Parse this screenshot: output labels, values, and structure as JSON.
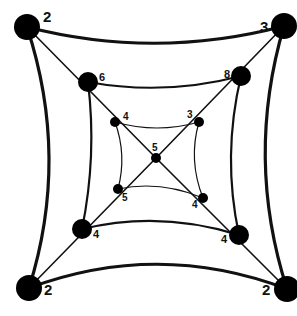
{
  "diagram": {
    "type": "nested-square-graph",
    "colors": {
      "stroke": "#111111",
      "node": "#000000",
      "background": "#ffffff"
    },
    "nodes": [
      {
        "id": "outer-tl",
        "ring": "outer",
        "x": 27,
        "y": 27,
        "r": 13,
        "label": "2",
        "lx": 43,
        "ly": 22,
        "fs": 15
      },
      {
        "id": "outer-tr",
        "ring": "outer",
        "x": 284,
        "y": 26,
        "r": 13,
        "label": "3",
        "lx": 260,
        "ly": 32,
        "fs": 15
      },
      {
        "id": "outer-bl",
        "ring": "outer",
        "x": 29,
        "y": 288,
        "r": 13,
        "label": "2",
        "lx": 44,
        "ly": 295,
        "fs": 15
      },
      {
        "id": "outer-br",
        "ring": "outer",
        "x": 287,
        "y": 289,
        "r": 13,
        "label": "2",
        "lx": 262,
        "ly": 295,
        "fs": 15
      },
      {
        "id": "middle-tl",
        "ring": "middle",
        "x": 88,
        "y": 82,
        "r": 10,
        "label": "6",
        "lx": 99,
        "ly": 81,
        "fs": 11
      },
      {
        "id": "middle-tr",
        "ring": "middle",
        "x": 241,
        "y": 76,
        "r": 10,
        "label": "8",
        "lx": 224,
        "ly": 78,
        "fs": 11
      },
      {
        "id": "middle-bl",
        "ring": "middle",
        "x": 82,
        "y": 229,
        "r": 10,
        "label": "4",
        "lx": 93,
        "ly": 238,
        "fs": 11
      },
      {
        "id": "middle-br",
        "ring": "middle",
        "x": 239,
        "y": 235,
        "r": 10,
        "label": "4",
        "lx": 221,
        "ly": 243,
        "fs": 11
      },
      {
        "id": "inner-tl",
        "ring": "inner",
        "x": 115,
        "y": 122,
        "r": 5,
        "label": "4",
        "lx": 123,
        "ly": 120,
        "fs": 10
      },
      {
        "id": "inner-tr",
        "ring": "inner",
        "x": 199,
        "y": 122,
        "r": 5,
        "label": "3",
        "lx": 187,
        "ly": 118,
        "fs": 10
      },
      {
        "id": "inner-bl",
        "ring": "inner",
        "x": 118,
        "y": 189,
        "r": 5,
        "label": "5",
        "lx": 122,
        "ly": 201,
        "fs": 10
      },
      {
        "id": "inner-br",
        "ring": "inner",
        "x": 203,
        "y": 198,
        "r": 5,
        "label": "4",
        "lx": 192,
        "ly": 208,
        "fs": 10
      },
      {
        "id": "center",
        "ring": "center",
        "x": 156,
        "y": 158,
        "r": 5,
        "label": "5",
        "lx": 152,
        "ly": 151,
        "fs": 10
      }
    ],
    "edges": [
      {
        "id": "outer-top",
        "d": "M27,27 Q156,60 284,26",
        "w": 3.2
      },
      {
        "id": "outer-right",
        "d": "M284,26 Q245,158 287,289",
        "w": 3.2
      },
      {
        "id": "outer-bottom",
        "d": "M29,288 Q158,240 287,289",
        "w": 3.2
      },
      {
        "id": "outer-left",
        "d": "M27,27 Q70,158 29,288",
        "w": 3.2
      },
      {
        "id": "middle-top",
        "d": "M88,82 Q165,96 241,76",
        "w": 2.2
      },
      {
        "id": "middle-right",
        "d": "M241,76 Q222,156 239,235",
        "w": 2.2
      },
      {
        "id": "middle-bottom",
        "d": "M82,229 Q160,210 239,235",
        "w": 2.2
      },
      {
        "id": "middle-left",
        "d": "M88,82 Q97,156 82,229",
        "w": 2.2
      },
      {
        "id": "inner-top",
        "d": "M115,122 Q157,134 199,122",
        "w": 1.2
      },
      {
        "id": "inner-right",
        "d": "M199,122 Q188,160 203,198",
        "w": 1.2
      },
      {
        "id": "inner-bottom",
        "d": "M118,189 Q160,180 203,198",
        "w": 1.2
      },
      {
        "id": "inner-left",
        "d": "M115,122 Q127,155 118,189",
        "w": 1.2
      },
      {
        "id": "diag-tl",
        "d": "M27,27 L156,158",
        "w": 1.6
      },
      {
        "id": "diag-tr",
        "d": "M284,26 L156,158",
        "w": 1.6
      },
      {
        "id": "diag-bl",
        "d": "M29,288 L156,158",
        "w": 1.6
      },
      {
        "id": "diag-br",
        "d": "M287,289 L156,158",
        "w": 1.6
      }
    ]
  }
}
